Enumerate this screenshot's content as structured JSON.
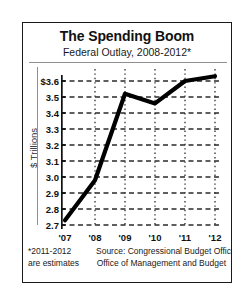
{
  "figure": {
    "title": "The Spending Boom",
    "subtitle": "Federal Outlay, 2008-2012*"
  },
  "footer": {
    "footnote_line1": "*2011-2012",
    "footnote_line2": "are estimates",
    "source_line1": "Source: Congressional Budget Office",
    "source_line2": "Office of Management and Budget"
  },
  "colors": {
    "line": "#000000",
    "grid": "#2b2b2b",
    "axis": "#111111",
    "rule": "#8f8f8f",
    "background": "#ffffff",
    "border": "#1a1a1a"
  },
  "chart_data": {
    "type": "line",
    "title": "The Spending Boom",
    "subtitle": "Federal Outlay, 2008-2012*",
    "xlabel": "",
    "ylabel": "$ Trillions",
    "categories": [
      "'07",
      "'08",
      "'09",
      "'10",
      "'11",
      "'12"
    ],
    "x_tick_labels": [
      "'07",
      "'08",
      "'09",
      "'10",
      "'11",
      "'12"
    ],
    "y_tick_labels": [
      "$3.6",
      "3.5",
      "3.4",
      "3.3",
      "3.2",
      "3.1",
      "3.0",
      "2.9",
      "2.8",
      "2.7"
    ],
    "y_tick_values": [
      3.6,
      3.5,
      3.4,
      3.3,
      3.2,
      3.1,
      3.0,
      2.9,
      2.8,
      2.7
    ],
    "ylim": [
      2.7,
      3.65
    ],
    "xlim": [
      0,
      5
    ],
    "values": [
      2.73,
      2.98,
      3.52,
      3.46,
      3.6,
      3.63
    ],
    "series": [
      {
        "name": "Federal Outlay",
        "values": [
          2.73,
          2.98,
          3.52,
          3.46,
          3.6,
          3.63
        ]
      }
    ],
    "grid": {
      "horizontal": "dashed",
      "vertical": "dotted"
    },
    "legend": "none",
    "annotations": [
      "*2011-2012 are estimates"
    ],
    "source": "Congressional Budget Office / Office of Management and Budget"
  }
}
